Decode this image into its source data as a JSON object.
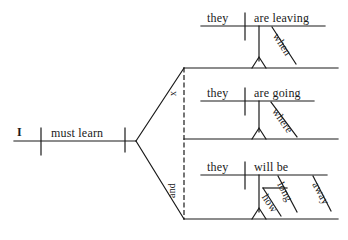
{
  "diagram": {
    "type": "reed-kellogg-sentence-diagram",
    "sentence": "I must learn when they are leaving, where they are going, and how long they will be away.",
    "ink_color": "#1a1a1a",
    "background_color": "#ffffff",
    "main_clause": {
      "subject": "I",
      "predicate": "must learn"
    },
    "connectors": {
      "upper_conjunction": "x",
      "lower_conjunction": "and"
    },
    "clauses": [
      {
        "id": "clause-when",
        "subject": "they",
        "predicate": "are leaving",
        "modifier": "when"
      },
      {
        "id": "clause-where",
        "subject": "they",
        "predicate": "are going",
        "modifier": "where"
      },
      {
        "id": "clause-how-long-away",
        "subject": "they",
        "predicate": "will be",
        "modifier_primary": "long",
        "modifier_secondary": "how",
        "modifier_complement": "away"
      }
    ]
  }
}
